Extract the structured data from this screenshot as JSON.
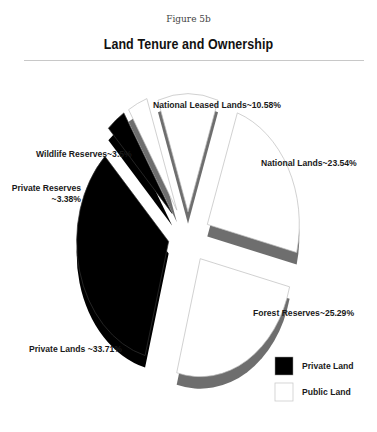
{
  "figure_label": "Figure 5b",
  "chart_data": {
    "type": "pie",
    "style": "exploded-3d",
    "title": "Land Tenure and Ownership",
    "slices": [
      {
        "name": "National Leased Lands",
        "value": 10.58,
        "label": "National Leased Lands~10.58%",
        "group": "Public Land"
      },
      {
        "name": "National Lands",
        "value": 23.54,
        "label": "National Lands~23.54%",
        "group": "Public Land"
      },
      {
        "name": "Forest Reserves",
        "value": 25.29,
        "label": "Forest Reserves~25.29%",
        "group": "Public Land"
      },
      {
        "name": "Private Lands",
        "value": 33.71,
        "label": "Private Lands ~33.71%",
        "group": "Private Land"
      },
      {
        "name": "Private Reserves",
        "value": 3.38,
        "label_lines": [
          "Private Reserves",
          "~3.38%"
        ],
        "group": "Private Land"
      },
      {
        "name": "Wildlife Reserves",
        "value": 3.5,
        "label": "Wildlife Reserves~3.5%",
        "group": "Public Land"
      }
    ],
    "legend": {
      "position": "bottom-right",
      "entries": [
        {
          "label": "Private Land",
          "color": "#000000"
        },
        {
          "label": "Public Land",
          "color": "#ffffff"
        }
      ]
    },
    "colors": {
      "private": "#000000",
      "public": "#ffffff",
      "side": "#6e6e6e",
      "edge": "#bdbdbd"
    }
  }
}
